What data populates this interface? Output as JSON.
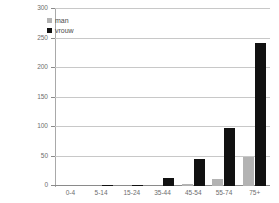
{
  "chart_data": {
    "type": "bar",
    "title": "",
    "subtitle": "",
    "xlabel": "",
    "ylabel": "",
    "categories": [
      "0-4",
      "5-14",
      "15-24",
      "35-44",
      "45-54",
      "55-74",
      "75+"
    ],
    "series": [
      {
        "name": "man",
        "color": "#b3b3b3",
        "values": [
          0,
          0,
          0,
          0,
          3,
          12,
          49
        ]
      },
      {
        "name": "vrouw",
        "color": "#111111",
        "values": [
          0,
          1,
          2,
          14,
          46,
          98,
          243
        ]
      }
    ],
    "ylim": [
      0,
      300
    ],
    "yticks": [
      0,
      50,
      100,
      150,
      200,
      250,
      300
    ],
    "ytick_labels": [
      "0",
      "50",
      "100",
      "150",
      "200",
      "250",
      "300"
    ],
    "grid": true,
    "legend_position": "top-left"
  },
  "legend": {
    "items": [
      {
        "label": "man",
        "color": "#b3b3b3",
        "swatch": "square-gray"
      },
      {
        "label": "vrouw",
        "color": "#111111",
        "swatch": "square-black"
      }
    ]
  },
  "colors": {
    "background": "#ffffff",
    "gridline": "#c8c8c8",
    "axis": "#8a8a8a",
    "man": "#b3b3b3",
    "vrouw": "#111111",
    "tick_text": "#6d6d6d"
  }
}
